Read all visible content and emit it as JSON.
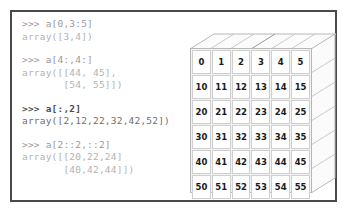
{
  "figure": {
    "frame_color": "#4a4a4a"
  },
  "console": {
    "blocks": [
      {
        "id": "block-1",
        "emphasis": "dim",
        "lines": [
          ">>> a[0,3:5]",
          "array([3,4])"
        ]
      },
      {
        "id": "block-2",
        "emphasis": "dim",
        "lines": [
          ">>> a[4:,4:]",
          "array([[44, 45],",
          "       [54, 55]])"
        ]
      },
      {
        "id": "block-3",
        "emphasis": "bold",
        "lines": [
          ">>> a[:,2]",
          "array([2,12,22,32,42,52])"
        ]
      },
      {
        "id": "block-4",
        "emphasis": "dim",
        "lines": [
          ">>> a[2::2,::2]",
          "array([[20,22,24]",
          "       [40,42,44]])"
        ]
      }
    ]
  },
  "chart_data": {
    "type": "table",
    "rows": 6,
    "cols": 6,
    "values": [
      [
        0,
        1,
        2,
        3,
        4,
        5
      ],
      [
        10,
        11,
        12,
        13,
        14,
        15
      ],
      [
        20,
        21,
        22,
        23,
        24,
        25
      ],
      [
        30,
        31,
        32,
        33,
        34,
        35
      ],
      [
        40,
        41,
        42,
        43,
        44,
        45
      ],
      [
        50,
        51,
        52,
        53,
        54,
        55
      ]
    ],
    "highlights": [
      {
        "name": "a[0,3:5]",
        "class": "h1",
        "cells": [
          [
            0,
            3
          ],
          [
            0,
            4
          ]
        ]
      },
      {
        "name": "a[4:,4:]",
        "class": "h2",
        "cells": [
          [
            4,
            4
          ],
          [
            4,
            5
          ],
          [
            5,
            4
          ],
          [
            5,
            5
          ]
        ]
      },
      {
        "name": "a[:,2]",
        "class": "h3",
        "cells": [
          [
            0,
            2
          ],
          [
            1,
            2
          ],
          [
            2,
            2
          ],
          [
            3,
            2
          ],
          [
            4,
            2
          ],
          [
            5,
            2
          ]
        ]
      },
      {
        "name": "a[2::2,::2]",
        "class": "h4",
        "cells": [
          [
            2,
            0
          ],
          [
            2,
            2
          ],
          [
            2,
            4
          ],
          [
            4,
            0
          ],
          [
            4,
            2
          ],
          [
            4,
            4
          ]
        ]
      }
    ],
    "cell_fill": "#ffffff",
    "cell_border": "#cfcfcf",
    "grid_background": "#f2f2f2"
  }
}
